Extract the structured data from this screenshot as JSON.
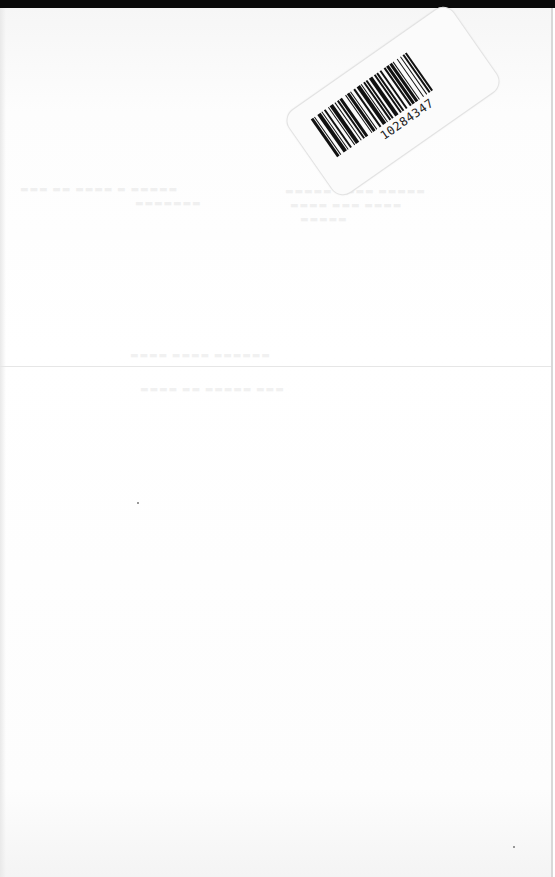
{
  "document": {
    "type": "scanned blank book endpaper",
    "background_color": "#ffffff",
    "top_bar_color": "#0a0a0a"
  },
  "barcode_label": {
    "number": "10284347",
    "bars": [
      2,
      1,
      1,
      2,
      3,
      1,
      1,
      1,
      2,
      2,
      1,
      1,
      3,
      1,
      1,
      2,
      1,
      1,
      2,
      3,
      1,
      1,
      2,
      1,
      1,
      2,
      2,
      1,
      3,
      1,
      1,
      1,
      2,
      1,
      1,
      2,
      3,
      1,
      2,
      1,
      1,
      2,
      1,
      3,
      1,
      1,
      2,
      1,
      2,
      1,
      1,
      3,
      1,
      2,
      1,
      1,
      2,
      1,
      1,
      2
    ]
  }
}
